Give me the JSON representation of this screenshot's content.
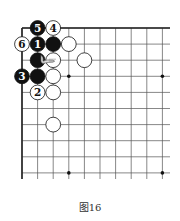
{
  "figure": {
    "caption": "图16",
    "grid": {
      "cols": 10,
      "rows": 10,
      "origin_x": 22,
      "origin_y": 28,
      "col_spacing": 15.6,
      "row_spacing": 16.1,
      "right_extent": 170,
      "bottom_extent": 179,
      "line_color": "#555555",
      "edge_color": "#222222"
    },
    "star_points": [
      [
        3,
        3
      ],
      [
        9,
        3
      ],
      [
        3,
        9
      ],
      [
        9,
        9
      ]
    ],
    "stones": [
      {
        "col": 1,
        "row": 0,
        "color": "black",
        "label": "5"
      },
      {
        "col": 2,
        "row": 0,
        "color": "white",
        "label": "4"
      },
      {
        "col": 0,
        "row": 1,
        "color": "white",
        "label": "6"
      },
      {
        "col": 1,
        "row": 1,
        "color": "black",
        "label": "1"
      },
      {
        "col": 2,
        "row": 1,
        "color": "black",
        "label": ""
      },
      {
        "col": 3,
        "row": 1,
        "color": "white",
        "label": ""
      },
      {
        "col": 1,
        "row": 2,
        "color": "black",
        "label": ""
      },
      {
        "col": 2,
        "row": 2,
        "color": "white",
        "label": ""
      },
      {
        "col": 4,
        "row": 2,
        "color": "white",
        "label": ""
      },
      {
        "col": 0,
        "row": 3,
        "color": "black",
        "label": "3"
      },
      {
        "col": 1,
        "row": 3,
        "color": "black",
        "label": ""
      },
      {
        "col": 2,
        "row": 3,
        "color": "white",
        "label": ""
      },
      {
        "col": 1,
        "row": 4,
        "color": "white",
        "label": "2"
      },
      {
        "col": 2,
        "row": 4,
        "color": "white",
        "label": ""
      },
      {
        "col": 2,
        "row": 6,
        "color": "white",
        "label": ""
      }
    ],
    "annotation": {
      "type": "pointing-hand",
      "col": 1.6,
      "row": 2
    }
  }
}
